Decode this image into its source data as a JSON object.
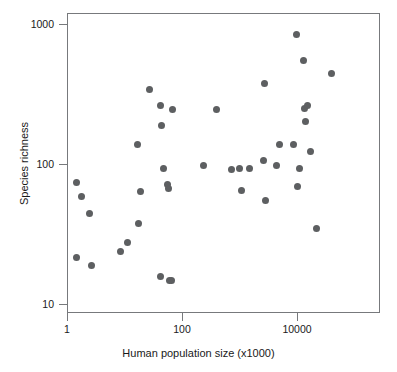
{
  "chart_data": {
    "type": "scatter",
    "title": "",
    "xlabel": "Human population size (x1000)",
    "ylabel": "Species richness",
    "xscale": "log",
    "yscale": "log",
    "xlim": [
      1,
      50000
    ],
    "ylim": [
      9,
      1100
    ],
    "grid": false,
    "legend": null,
    "xticks": [
      {
        "value": 1,
        "label": "1"
      },
      {
        "value": 100,
        "label": "100"
      },
      {
        "value": 10000,
        "label": "10000"
      }
    ],
    "yticks": [
      {
        "value": 10,
        "label": "10"
      },
      {
        "value": 100,
        "label": "100"
      },
      {
        "value": 1000,
        "label": "1000"
      }
    ],
    "marker": {
      "shape": "circle",
      "color": "#5d5f61",
      "size_px": 7
    },
    "series": [
      {
        "name": "cities",
        "points": [
          {
            "x": 1.4,
            "y": 75
          },
          {
            "x": 1.7,
            "y": 60
          },
          {
            "x": 2.4,
            "y": 45
          },
          {
            "x": 1.4,
            "y": 22
          },
          {
            "x": 2.6,
            "y": 19
          },
          {
            "x": 8.2,
            "y": 24
          },
          {
            "x": 11,
            "y": 28
          },
          {
            "x": 17,
            "y": 38
          },
          {
            "x": 16,
            "y": 140
          },
          {
            "x": 18,
            "y": 65
          },
          {
            "x": 26,
            "y": 345
          },
          {
            "x": 40,
            "y": 265
          },
          {
            "x": 42,
            "y": 190
          },
          {
            "x": 46,
            "y": 95
          },
          {
            "x": 54,
            "y": 72
          },
          {
            "x": 55,
            "y": 68
          },
          {
            "x": 66,
            "y": 250
          },
          {
            "x": 40,
            "y": 16
          },
          {
            "x": 58,
            "y": 15
          },
          {
            "x": 64,
            "y": 15
          },
          {
            "x": 230,
            "y": 100
          },
          {
            "x": 690,
            "y": 93
          },
          {
            "x": 980,
            "y": 95
          },
          {
            "x": 380,
            "y": 250
          },
          {
            "x": 1050,
            "y": 66
          },
          {
            "x": 1450,
            "y": 95
          },
          {
            "x": 2600,
            "y": 380
          },
          {
            "x": 2500,
            "y": 108
          },
          {
            "x": 2700,
            "y": 56
          },
          {
            "x": 4200,
            "y": 100
          },
          {
            "x": 4800,
            "y": 140
          },
          {
            "x": 8500,
            "y": 140
          },
          {
            "x": 9500,
            "y": 850
          },
          {
            "x": 9800,
            "y": 70
          },
          {
            "x": 10500,
            "y": 95
          },
          {
            "x": 12500,
            "y": 560
          },
          {
            "x": 13000,
            "y": 255
          },
          {
            "x": 14500,
            "y": 265
          },
          {
            "x": 13500,
            "y": 205
          },
          {
            "x": 16500,
            "y": 125
          },
          {
            "x": 21000,
            "y": 35
          },
          {
            "x": 38000,
            "y": 450
          }
        ]
      }
    ]
  },
  "figure": {
    "background_color": "#ffffff",
    "frame_color": "#77797c"
  }
}
